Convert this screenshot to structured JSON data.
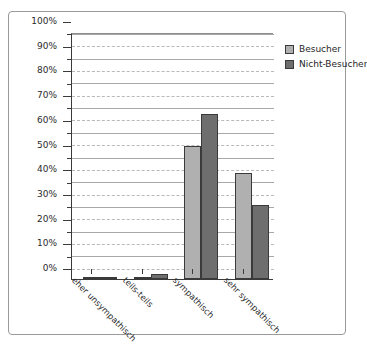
{
  "figure": {
    "top_cut_text": "",
    "frame_color": "#9a9a9a"
  },
  "legend": {
    "position": "top-right-inside",
    "entries": [
      {
        "label": "Besucher",
        "color": "#b0b0b0"
      },
      {
        "label": "Nicht-Besucher",
        "color": "#6e6e6e"
      }
    ]
  },
  "axis": {
    "y_ticks": [
      "0%",
      "10%",
      "20%",
      "30%",
      "40%",
      "50%",
      "60%",
      "70%",
      "80%",
      "90%",
      "100%"
    ],
    "x_categories": [
      "eher unsympathisch",
      "teils-teils",
      "sympathisch",
      "sehr sympathisch"
    ]
  },
  "chart_data": {
    "type": "bar",
    "title": "",
    "subtitle": "",
    "xlabel": "",
    "ylabel": "",
    "ylim": [
      0,
      100
    ],
    "y_unit": "%",
    "y_major_step": 10,
    "y_minor_step": 5,
    "grid": true,
    "grid_major_style": "solid",
    "grid_minor_style": "dashed",
    "legend_position": "top-right",
    "categories": [
      "eher unsympathisch",
      "teils-teils",
      "sympathisch",
      "sehr sympathisch"
    ],
    "series": [
      {
        "name": "Besucher",
        "color": "#b0b0b0",
        "values": [
          0.5,
          1,
          54,
          43
        ]
      },
      {
        "name": "Nicht-Besucher",
        "color": "#6e6e6e",
        "values": [
          1,
          2,
          67,
          30
        ]
      }
    ]
  }
}
